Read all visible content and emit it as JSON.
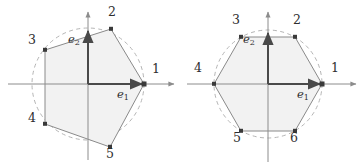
{
  "figure_set": {
    "background_color": "#ffffff",
    "stroke_color": "#7a7a7a",
    "axis_color": "#8c8c8c",
    "vector_color": "#4a4a4a",
    "fill_color": "#f2f2f2",
    "dashed_circle_color": "#b0b0b0",
    "label_color": "#2e2e2e"
  },
  "figures": [
    {
      "id": "left-figure",
      "name": "irregular-pentagon-figure",
      "shape_type": "pentagon",
      "vertex_count": 5,
      "origin": {
        "x": 88,
        "y": 84
      },
      "unit": 56,
      "circle_radius": 56,
      "circle_dashed": true,
      "axes": {
        "x_axis": {
          "from_x": 8,
          "to_x": 176,
          "arrow": "right"
        },
        "y_axis": {
          "from_y": 160,
          "to_y": 10,
          "arrow": "up"
        }
      },
      "basis_vectors": [
        {
          "name": "e1",
          "label": "e",
          "sub": "1",
          "dx": 56,
          "dy": 0,
          "label_x": 118,
          "label_y": 96
        },
        {
          "name": "e2",
          "label": "e",
          "sub": "2",
          "dx": 0,
          "dy": -56,
          "label_x": 70,
          "label_y": 40
        }
      ],
      "vertices": [
        {
          "label": "1",
          "x": 144,
          "y": 84,
          "label_x": 152,
          "label_y": 67
        },
        {
          "label": "2",
          "x": 111,
          "y": 29,
          "label_x": 108,
          "label_y": 10
        },
        {
          "label": "3",
          "x": 45,
          "y": 50,
          "label_x": 29,
          "label_y": 38
        },
        {
          "label": "4",
          "x": 45,
          "y": 124,
          "label_x": 29,
          "label_y": 115
        },
        {
          "label": "5",
          "x": 110,
          "y": 147,
          "label_x": 107,
          "label_y": 150
        }
      ]
    },
    {
      "id": "right-figure",
      "name": "regular-hexagon-figure",
      "shape_type": "hexagon",
      "vertex_count": 6,
      "origin": {
        "x": 87,
        "y": 84
      },
      "unit": 54,
      "circle_radius": 54,
      "circle_dashed": true,
      "axes": {
        "x_axis": {
          "from_x": 6,
          "to_x": 176,
          "arrow": "right"
        },
        "y_axis": {
          "from_y": 162,
          "to_y": 10,
          "arrow": "up"
        }
      },
      "basis_vectors": [
        {
          "name": "e1",
          "label": "e",
          "sub": "1",
          "dx": 54,
          "dy": 0,
          "label_x": 117,
          "label_y": 96
        },
        {
          "name": "e2",
          "label": "e",
          "sub": "2",
          "dx": 0,
          "dy": -54,
          "label_x": 64,
          "label_y": 40
        }
      ],
      "vertices": [
        {
          "label": "1",
          "x": 141,
          "y": 84,
          "label_x": 150,
          "label_y": 66
        },
        {
          "label": "2",
          "x": 114,
          "y": 37,
          "label_x": 112,
          "label_y": 18
        },
        {
          "label": "3",
          "x": 60,
          "y": 37,
          "label_x": 52,
          "label_y": 18
        },
        {
          "label": "4",
          "x": 33,
          "y": 84,
          "label_x": 14,
          "label_y": 66
        },
        {
          "label": "5",
          "x": 60,
          "y": 131,
          "label_x": 53,
          "label_y": 134
        },
        {
          "label": "6",
          "x": 114,
          "y": 131,
          "label_x": 110,
          "label_y": 134
        }
      ]
    }
  ]
}
